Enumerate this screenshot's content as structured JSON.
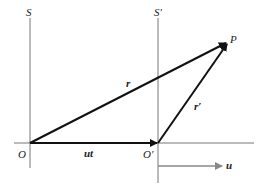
{
  "diagram": {
    "type": "galilean-transformation",
    "frames": [
      {
        "label": "S",
        "origin_label": "O"
      },
      {
        "label": "S′",
        "origin_label": "O′"
      }
    ],
    "point_label": "P",
    "vectors": {
      "r": "r",
      "r_prime": "r′",
      "ut": "ut",
      "u": "u"
    },
    "colors": {
      "axis": "#777777",
      "vector": "#111111",
      "velocity_arrow": "#888888",
      "background": "#ffffff"
    }
  }
}
